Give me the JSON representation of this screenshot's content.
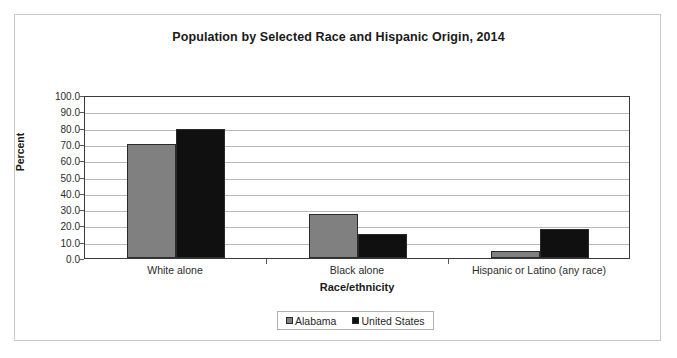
{
  "chart_data": {
    "type": "bar",
    "title": "Population by Selected Race and Hispanic Origin, 2014",
    "xlabel": "Race/ethnicity",
    "ylabel": "Percent",
    "categories": [
      "White alone",
      "Black alone",
      "Hispanic or Latino (any race)"
    ],
    "series": [
      {
        "name": "Alabama",
        "color": "#808080",
        "values": [
          70.0,
          27.0,
          4.5
        ]
      },
      {
        "name": "United States",
        "color": "#101010",
        "values": [
          79.0,
          14.5,
          17.5
        ]
      }
    ],
    "ylim": [
      0.0,
      100.0
    ],
    "ytick_labels": [
      "100.0",
      "90.0",
      "80.0",
      "70.0",
      "60.0",
      "50.0",
      "40.0",
      "30.0",
      "20.0",
      "10.0",
      "0.0"
    ],
    "ytick_values": [
      100.0,
      90.0,
      80.0,
      70.0,
      60.0,
      50.0,
      40.0,
      30.0,
      20.0,
      10.0,
      0.0
    ],
    "grid": true,
    "legend_position": "bottom-center"
  }
}
